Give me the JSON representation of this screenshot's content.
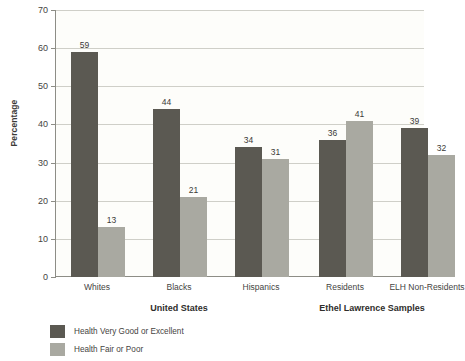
{
  "chart_data": {
    "type": "bar",
    "title": "",
    "xlabel": "",
    "ylabel": "Percentage",
    "ylim": [
      0,
      70
    ],
    "yticks": [
      0,
      10,
      20,
      30,
      40,
      50,
      60,
      70
    ],
    "ytick_labels": [
      "0",
      "10",
      "20",
      "30",
      "40",
      "50",
      "60",
      "70"
    ],
    "grid": true,
    "legend_position": "bottom-left",
    "categories": [
      "Whites",
      "Blacks",
      "Hispanics",
      "Residents",
      "ELH Non-Residents"
    ],
    "groups": [
      {
        "label": "United States",
        "categories": [
          "Whites",
          "Blacks",
          "Hispanics"
        ]
      },
      {
        "label": "Ethel Lawrence Samples",
        "categories": [
          "Residents",
          "ELH Non-Residents"
        ]
      }
    ],
    "series": [
      {
        "name": "Health Very Good or Excellent",
        "color": "#5b5952",
        "values": [
          59,
          44,
          34,
          36,
          39
        ]
      },
      {
        "name": "Health Fair or Poor",
        "color": "#a9a9a1",
        "values": [
          13,
          21,
          31,
          41,
          32
        ]
      }
    ]
  },
  "colors": {
    "series_dark": "#5b5952",
    "series_light": "#a9a9a1",
    "axis": "#8d8d86",
    "gridline": "#cfcfc8",
    "plot_background": "#fdfdfa",
    "text": "#3b3a37"
  }
}
